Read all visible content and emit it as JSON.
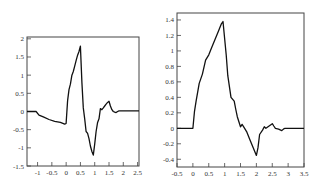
{
  "chart_data": [
    {
      "type": "line",
      "title": "",
      "xlabel": "",
      "ylabel": "",
      "xlim": [
        -1.37,
        2.55
      ],
      "ylim": [
        -1.5,
        2.05
      ],
      "grid": false,
      "legend": null,
      "xticks": [
        "-1",
        "-0.5",
        "0",
        "0.5",
        "1",
        "1.5",
        "2",
        "2.5"
      ],
      "xtick_values": [
        -1,
        -0.5,
        0,
        0.5,
        1,
        1.5,
        2,
        2.5
      ],
      "yticks": [
        "2",
        "1.5",
        "1",
        "0.5",
        "0",
        "-0.5",
        "-1",
        "-1.5"
      ],
      "ytick_values": [
        2,
        1.5,
        1,
        0.5,
        0,
        -0.5,
        -1,
        -1.5
      ],
      "series": [
        {
          "name": "signal",
          "x": [
            -1.37,
            -1.05,
            -0.95,
            -0.8,
            -0.6,
            -0.4,
            -0.2,
            -0.05,
            0.0,
            0.05,
            0.1,
            0.15,
            0.2,
            0.25,
            0.3,
            0.35,
            0.4,
            0.45,
            0.5,
            0.55,
            0.6,
            0.65,
            0.7,
            0.75,
            0.8,
            0.85,
            0.9,
            0.95,
            1.0,
            1.05,
            1.1,
            1.15,
            1.2,
            1.25,
            1.3,
            1.35,
            1.4,
            1.45,
            1.5,
            1.55,
            1.6,
            1.65,
            1.7,
            1.75,
            1.8,
            1.85,
            2.0,
            2.2,
            2.55
          ],
          "y": [
            0.0,
            0.0,
            -0.1,
            -0.15,
            -0.22,
            -0.27,
            -0.3,
            -0.35,
            -0.33,
            0.3,
            0.6,
            0.75,
            1.0,
            1.1,
            1.25,
            1.4,
            1.55,
            1.65,
            1.8,
            0.8,
            0.1,
            -0.2,
            -0.55,
            -0.6,
            -0.75,
            -0.95,
            -1.1,
            -1.2,
            -0.9,
            -0.55,
            -0.3,
            -0.2,
            0.08,
            0.05,
            0.1,
            0.15,
            0.2,
            0.25,
            0.28,
            0.15,
            0.05,
            0.0,
            -0.02,
            -0.03,
            0.0,
            0.02,
            0.02,
            0.02,
            0.02
          ]
        }
      ]
    },
    {
      "type": "line",
      "title": "",
      "xlabel": "",
      "ylabel": "",
      "xlim": [
        -0.5,
        3.5
      ],
      "ylim": [
        -0.5,
        1.49
      ],
      "grid": false,
      "legend": null,
      "xticks": [
        "-0.5",
        "0",
        "0.5",
        "1",
        "1.5",
        "2",
        "2.5",
        "3",
        "3.5"
      ],
      "xtick_values": [
        -0.5,
        0,
        0.5,
        1,
        1.5,
        2,
        2.5,
        3,
        3.5
      ],
      "yticks": [
        "1.4",
        "1.2",
        "1",
        "0.8",
        "0.6",
        "0.4",
        "0.2",
        "0",
        "-0.2",
        "-0.4"
      ],
      "ytick_values": [
        1.4,
        1.2,
        1.0,
        0.8,
        0.6,
        0.4,
        0.2,
        0.0,
        -0.2,
        -0.4
      ],
      "series": [
        {
          "name": "signal",
          "x": [
            -0.5,
            0.0,
            0.05,
            0.1,
            0.2,
            0.3,
            0.4,
            0.5,
            0.6,
            0.7,
            0.8,
            0.9,
            0.95,
            1.05,
            1.1,
            1.2,
            1.3,
            1.35,
            1.4,
            1.5,
            1.55,
            1.6,
            1.7,
            1.75,
            1.8,
            1.9,
            2.0,
            2.05,
            2.1,
            2.2,
            2.25,
            2.3,
            2.4,
            2.5,
            2.55,
            2.6,
            2.7,
            2.8,
            2.85,
            2.9,
            3.0,
            3.2,
            3.5
          ],
          "y": [
            0.0,
            0.0,
            0.22,
            0.35,
            0.58,
            0.7,
            0.88,
            0.95,
            1.05,
            1.15,
            1.25,
            1.35,
            1.38,
            0.95,
            0.68,
            0.4,
            0.35,
            0.25,
            0.15,
            0.02,
            0.05,
            0.02,
            -0.05,
            -0.1,
            -0.15,
            -0.25,
            -0.35,
            -0.25,
            -0.08,
            -0.02,
            0.02,
            0.0,
            0.03,
            0.06,
            0.03,
            0.0,
            -0.01,
            -0.03,
            -0.01,
            0.0,
            0.0,
            0.0,
            0.0
          ]
        }
      ]
    }
  ],
  "charts": [
    {
      "box": {
        "left": 27,
        "top": 37,
        "right": 139,
        "bottom": 166
      },
      "xlim": [
        -1.37,
        2.55
      ],
      "ylim": [
        -1.5,
        2.05
      ]
    },
    {
      "box": {
        "left": 177,
        "top": 13,
        "right": 304,
        "bottom": 167
      },
      "xlim": [
        -0.5,
        3.5
      ],
      "ylim": [
        -0.5,
        1.49
      ]
    }
  ],
  "colors": {
    "axis": "#444444",
    "line": "#111111",
    "label": "#333333"
  }
}
